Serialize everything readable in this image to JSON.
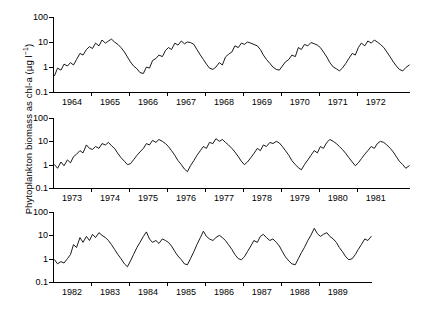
{
  "figure": {
    "ylabel_main": "Phytoplankton biomass as chl-a (µg l",
    "ylabel_exp": "−1",
    "ylabel_close": ")",
    "background": "#ffffff",
    "line_color": "#000000",
    "axis_color": "#000000"
  },
  "chart_data": {
    "type": "line",
    "title": "",
    "xlabel": "",
    "ylabel": "Phytoplankton biomass as chl-a (µg l⁻¹)",
    "yscale": "log",
    "ylim": [
      0.1,
      100
    ],
    "ytick_labels": [
      "100",
      "10",
      "1",
      "0.1"
    ],
    "ytick_values": [
      100,
      10,
      1,
      0.1
    ],
    "grid": false,
    "legend": "none",
    "panels": [
      {
        "name": "panel-1",
        "xlim": [
          1963.5,
          1972.9
        ],
        "categories": [
          "1964",
          "1965",
          "1966",
          "1967",
          "1968",
          "1969",
          "1970",
          "1971",
          "1972"
        ],
        "x": [
          1963.54,
          1963.62,
          1963.71,
          1963.79,
          1963.88,
          1963.96,
          1964.04,
          1964.12,
          1964.21,
          1964.29,
          1964.38,
          1964.46,
          1964.54,
          1964.62,
          1964.71,
          1964.79,
          1964.88,
          1964.96,
          1965.04,
          1965.12,
          1965.21,
          1965.29,
          1965.38,
          1965.46,
          1965.54,
          1965.62,
          1965.71,
          1965.79,
          1965.88,
          1965.96,
          1966.04,
          1966.12,
          1966.21,
          1966.29,
          1966.38,
          1966.46,
          1966.54,
          1966.62,
          1966.71,
          1966.79,
          1966.88,
          1966.96,
          1967.04,
          1967.12,
          1967.21,
          1967.29,
          1967.38,
          1967.46,
          1967.54,
          1967.62,
          1967.71,
          1967.79,
          1967.88,
          1967.96,
          1968.04,
          1968.12,
          1968.21,
          1968.29,
          1968.38,
          1968.46,
          1968.54,
          1968.62,
          1968.71,
          1968.79,
          1968.88,
          1968.96,
          1969.04,
          1969.12,
          1969.21,
          1969.29,
          1969.38,
          1969.46,
          1969.54,
          1969.62,
          1969.71,
          1969.79,
          1969.88,
          1969.96,
          1970.04,
          1970.12,
          1970.21,
          1970.29,
          1970.38,
          1970.46,
          1970.54,
          1970.62,
          1970.71,
          1970.79,
          1970.88,
          1970.96,
          1971.04,
          1971.12,
          1971.21,
          1971.29,
          1971.38,
          1971.46,
          1971.54,
          1971.62,
          1971.71,
          1971.79,
          1971.88,
          1971.96,
          1972.04,
          1972.12,
          1972.21,
          1972.29,
          1972.38,
          1972.46,
          1972.54,
          1972.62,
          1972.71,
          1972.79,
          1972.88
        ],
        "values": [
          0.45,
          0.9,
          0.75,
          1.3,
          1.1,
          1.5,
          1.2,
          2.0,
          3.5,
          3.0,
          5.0,
          6.5,
          5.5,
          9.0,
          7.0,
          12.0,
          9.0,
          11.0,
          13.0,
          10.0,
          8.0,
          6.0,
          4.0,
          2.5,
          1.6,
          1.1,
          0.85,
          0.6,
          0.55,
          1.0,
          0.9,
          1.8,
          2.2,
          3.0,
          2.6,
          4.5,
          6.0,
          5.0,
          9.0,
          7.5,
          11.0,
          8.5,
          10.0,
          9.5,
          8.0,
          5.0,
          3.0,
          2.0,
          1.3,
          0.9,
          0.8,
          1.0,
          1.5,
          1.2,
          2.5,
          3.2,
          4.0,
          7.0,
          6.0,
          9.0,
          8.0,
          10.0,
          9.0,
          8.0,
          7.0,
          5.0,
          3.0,
          2.0,
          1.4,
          1.0,
          0.8,
          0.75,
          1.1,
          1.6,
          2.0,
          3.0,
          2.6,
          6.0,
          5.0,
          8.0,
          7.0,
          9.5,
          8.5,
          7.5,
          6.0,
          4.0,
          2.5,
          1.5,
          1.0,
          0.85,
          0.7,
          0.9,
          1.4,
          2.2,
          3.5,
          3.0,
          6.0,
          9.0,
          7.0,
          11.0,
          9.0,
          12.0,
          10.0,
          8.0,
          6.0,
          4.0,
          2.5,
          1.6,
          1.1,
          0.8,
          0.7,
          0.95,
          1.2
        ]
      },
      {
        "name": "panel-2",
        "xlim": [
          1972.5,
          1981.9
        ],
        "categories": [
          "1973",
          "1974",
          "1975",
          "1976",
          "1977",
          "1978",
          "1979",
          "1980",
          "1981"
        ],
        "x": [
          1972.54,
          1972.62,
          1972.71,
          1972.79,
          1972.88,
          1972.96,
          1973.04,
          1973.12,
          1973.21,
          1973.29,
          1973.38,
          1973.46,
          1973.54,
          1973.62,
          1973.71,
          1973.79,
          1973.88,
          1973.96,
          1974.04,
          1974.12,
          1974.21,
          1974.29,
          1974.38,
          1974.46,
          1974.54,
          1974.62,
          1974.71,
          1974.79,
          1974.88,
          1974.96,
          1975.04,
          1975.12,
          1975.21,
          1975.29,
          1975.38,
          1975.46,
          1975.54,
          1975.62,
          1975.71,
          1975.79,
          1975.88,
          1975.96,
          1976.04,
          1976.12,
          1976.21,
          1976.29,
          1976.38,
          1976.46,
          1976.54,
          1976.62,
          1976.71,
          1976.79,
          1976.88,
          1976.96,
          1977.04,
          1977.12,
          1977.21,
          1977.29,
          1977.38,
          1977.46,
          1977.54,
          1977.62,
          1977.71,
          1977.79,
          1977.88,
          1977.96,
          1978.04,
          1978.12,
          1978.21,
          1978.29,
          1978.38,
          1978.46,
          1978.54,
          1978.62,
          1978.71,
          1978.79,
          1978.88,
          1978.96,
          1979.04,
          1979.12,
          1979.21,
          1979.29,
          1979.38,
          1979.46,
          1979.54,
          1979.62,
          1979.71,
          1979.79,
          1979.88,
          1979.96,
          1980.04,
          1980.12,
          1980.21,
          1980.29,
          1980.38,
          1980.46,
          1980.54,
          1980.62,
          1980.71,
          1980.79,
          1980.88,
          1980.96,
          1981.04,
          1981.12,
          1981.21,
          1981.29,
          1981.38,
          1981.46,
          1981.54,
          1981.62,
          1981.71,
          1981.79,
          1981.88
        ],
        "values": [
          1.0,
          0.7,
          1.3,
          0.9,
          1.6,
          1.2,
          2.2,
          2.8,
          4.0,
          3.2,
          7.0,
          5.0,
          4.5,
          6.0,
          5.0,
          8.0,
          7.0,
          9.0,
          6.5,
          5.0,
          3.0,
          2.0,
          1.4,
          1.0,
          1.1,
          1.6,
          2.5,
          3.5,
          5.0,
          8.0,
          7.0,
          11.0,
          9.0,
          12.0,
          10.0,
          8.0,
          6.0,
          4.0,
          2.5,
          1.5,
          1.0,
          0.65,
          0.5,
          0.9,
          1.5,
          2.5,
          4.0,
          6.0,
          5.0,
          9.0,
          8.0,
          13.0,
          10.0,
          12.0,
          9.0,
          7.0,
          5.0,
          3.5,
          2.2,
          1.4,
          1.0,
          1.3,
          2.0,
          3.0,
          5.0,
          4.0,
          7.0,
          6.0,
          9.0,
          8.0,
          10.0,
          8.5,
          6.0,
          4.0,
          2.5,
          1.5,
          1.0,
          0.75,
          0.6,
          1.0,
          1.6,
          2.5,
          4.0,
          3.2,
          6.0,
          5.0,
          9.0,
          12.0,
          10.0,
          8.0,
          6.0,
          4.5,
          3.0,
          2.0,
          1.3,
          0.9,
          1.2,
          1.8,
          2.8,
          4.0,
          6.0,
          5.0,
          8.0,
          10.0,
          9.0,
          7.0,
          5.0,
          3.5,
          2.2,
          1.4,
          1.0,
          0.7,
          0.9
        ]
      },
      {
        "name": "panel-3",
        "xlim": [
          1981.5,
          1989.9
        ],
        "categories": [
          "1982",
          "1983",
          "1984",
          "1985",
          "1986",
          "1987",
          "1988",
          "1989"
        ],
        "x": [
          1981.54,
          1981.62,
          1981.71,
          1981.79,
          1981.88,
          1981.96,
          1982.04,
          1982.12,
          1982.21,
          1982.29,
          1982.38,
          1982.46,
          1982.54,
          1982.62,
          1982.71,
          1982.79,
          1982.88,
          1982.96,
          1983.04,
          1983.12,
          1983.21,
          1983.29,
          1983.38,
          1983.46,
          1983.54,
          1983.62,
          1983.71,
          1983.79,
          1983.88,
          1983.96,
          1984.04,
          1984.12,
          1984.21,
          1984.29,
          1984.38,
          1984.46,
          1984.54,
          1984.62,
          1984.71,
          1984.79,
          1984.88,
          1984.96,
          1985.04,
          1985.12,
          1985.21,
          1985.29,
          1985.38,
          1985.46,
          1985.54,
          1985.62,
          1985.71,
          1985.79,
          1985.88,
          1985.96,
          1986.04,
          1986.12,
          1986.21,
          1986.29,
          1986.38,
          1986.46,
          1986.54,
          1986.62,
          1986.71,
          1986.79,
          1986.88,
          1986.96,
          1987.04,
          1987.12,
          1987.21,
          1987.29,
          1987.38,
          1987.46,
          1987.54,
          1987.62,
          1987.71,
          1987.79,
          1987.88,
          1987.96,
          1988.04,
          1988.12,
          1988.21,
          1988.29,
          1988.38,
          1988.46,
          1988.54,
          1988.62,
          1988.71,
          1988.79,
          1988.88,
          1988.96,
          1989.04,
          1989.12,
          1989.21,
          1989.29,
          1989.38,
          1989.46,
          1989.54,
          1989.62,
          1989.71,
          1989.79,
          1989.88
        ],
        "values": [
          0.9,
          0.6,
          0.75,
          0.65,
          1.0,
          1.5,
          4.0,
          3.0,
          8.0,
          5.0,
          9.0,
          6.0,
          11.0,
          8.0,
          13.0,
          10.0,
          8.0,
          6.0,
          4.0,
          2.5,
          1.5,
          1.0,
          0.6,
          0.45,
          0.8,
          1.5,
          3.0,
          5.0,
          9.0,
          14.0,
          7.0,
          5.0,
          6.0,
          4.5,
          7.0,
          6.0,
          5.0,
          3.5,
          2.0,
          1.3,
          0.9,
          0.6,
          0.55,
          1.0,
          2.0,
          4.0,
          8.0,
          15.0,
          9.0,
          7.0,
          6.0,
          8.0,
          10.0,
          8.0,
          6.0,
          4.0,
          2.5,
          1.5,
          1.0,
          0.9,
          1.2,
          2.0,
          3.5,
          6.0,
          5.0,
          9.0,
          11.0,
          8.0,
          6.0,
          7.0,
          5.0,
          3.5,
          2.0,
          1.2,
          0.8,
          0.6,
          0.55,
          1.0,
          1.8,
          3.0,
          6.0,
          10.0,
          20.0,
          12.0,
          9.0,
          11.0,
          13.0,
          9.0,
          7.0,
          5.0,
          3.0,
          2.0,
          1.2,
          0.9,
          1.0,
          1.5,
          2.5,
          4.0,
          7.0,
          6.0,
          9.0,
          12.0,
          10.0
        ]
      }
    ]
  }
}
